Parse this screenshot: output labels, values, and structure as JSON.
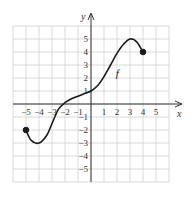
{
  "chart_data": {
    "type": "line",
    "title": "",
    "xlabel": "x",
    "ylabel": "y",
    "function_label": "f",
    "xlim": [
      -6,
      6
    ],
    "ylim": [
      -6,
      6
    ],
    "grid": true,
    "x_ticks": [
      "-5",
      "-4",
      "-3",
      "-2",
      "-1",
      "1",
      "2",
      "3",
      "4",
      "5"
    ],
    "y_ticks": [
      "5",
      "4",
      "3",
      "2",
      "1",
      "-1",
      "-2",
      "-3",
      "-4",
      "-5"
    ],
    "series": [
      {
        "name": "f",
        "points": [
          [
            -5,
            -2
          ],
          [
            -4.6,
            -2.8
          ],
          [
            -4,
            -3
          ],
          [
            -3.4,
            -2.4
          ],
          [
            -3,
            -1.5
          ],
          [
            -2.5,
            -0.4
          ],
          [
            -2,
            0.1
          ],
          [
            -1.5,
            0.4
          ],
          [
            -1,
            0.6
          ],
          [
            -0.5,
            0.8
          ],
          [
            0,
            1
          ],
          [
            0.5,
            1.4
          ],
          [
            1,
            2.1
          ],
          [
            1.5,
            3
          ],
          [
            2,
            3.9
          ],
          [
            2.5,
            4.6
          ],
          [
            3,
            5
          ],
          [
            3.5,
            4.8
          ],
          [
            4,
            4
          ]
        ],
        "endpoints": [
          {
            "x": -5,
            "y": -2,
            "filled": true
          },
          {
            "x": 4,
            "y": 4,
            "filled": true
          }
        ]
      }
    ],
    "colors": {
      "curve": "#1a1a1a",
      "grid": "#d0d0d0",
      "axis": "#333333"
    }
  }
}
